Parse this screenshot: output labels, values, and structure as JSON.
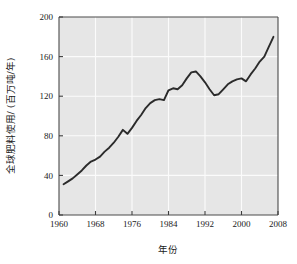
{
  "chart_data": {
    "type": "line",
    "title": "",
    "xlabel": "年份",
    "ylabel": "全球肥料使用/ (百万吨/年)",
    "xlim": [
      1960,
      2008
    ],
    "ylim": [
      0,
      200
    ],
    "xticks": [
      "1960",
      "1968",
      "1976",
      "1984",
      "1992",
      "2000",
      "2008"
    ],
    "yticks": [
      "0",
      "40",
      "80",
      "120",
      "160",
      "200"
    ],
    "grid": true,
    "legend": "none",
    "series": [
      {
        "name": "全球肥料使用",
        "x": [
          1961,
          1962,
          1963,
          1964,
          1965,
          1966,
          1967,
          1968,
          1969,
          1970,
          1971,
          1972,
          1973,
          1974,
          1975,
          1976,
          1977,
          1978,
          1979,
          1980,
          1981,
          1982,
          1983,
          1984,
          1985,
          1986,
          1987,
          1988,
          1989,
          1990,
          1991,
          1992,
          1993,
          1994,
          1995,
          1996,
          1997,
          1998,
          1999,
          2000,
          2001,
          2002,
          2003,
          2004,
          2005,
          2006,
          2007
        ],
        "values": [
          31,
          34,
          37,
          41,
          45,
          50,
          54,
          56,
          59,
          64,
          68,
          73,
          79,
          86,
          82,
          88,
          95,
          101,
          108,
          113,
          116,
          117,
          116,
          126,
          128,
          127,
          131,
          138,
          144,
          145,
          140,
          134,
          127,
          121,
          122,
          127,
          132,
          135,
          137,
          138,
          135,
          142,
          148,
          155,
          160,
          170,
          180
        ]
      }
    ]
  },
  "figure": {
    "axis_label_x": "年份",
    "axis_label_y": "全球肥料使用/ (百万吨/年)"
  }
}
